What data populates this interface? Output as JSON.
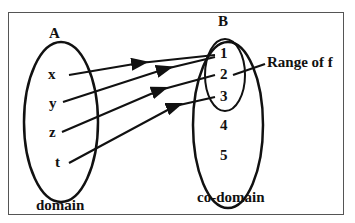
{
  "diagram": {
    "set_a": {
      "label": "A",
      "caption": "domain",
      "elements": [
        "x",
        "y",
        "z",
        "t"
      ]
    },
    "set_b": {
      "label": "B",
      "caption": "co-domain",
      "elements": [
        "1",
        "2",
        "3",
        "4",
        "5"
      ]
    },
    "range_label": "Range of f",
    "mappings": [
      {
        "from": "x",
        "to": "1"
      },
      {
        "from": "y",
        "to": "1"
      },
      {
        "from": "z",
        "to": "2"
      },
      {
        "from": "t",
        "to": "3"
      }
    ],
    "colors": {
      "stroke": "#111111",
      "border": "#555555",
      "background": "#ffffff"
    }
  }
}
